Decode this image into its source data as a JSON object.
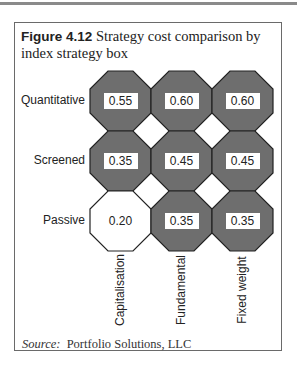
{
  "figure": {
    "number": "Figure 4.12",
    "title": "Strategy cost comparison by index strategy box",
    "source_label": "Source:",
    "source_text": "Portfolio Solutions, LLC"
  },
  "rows": [
    "Quantitative",
    "Screened",
    "Passive"
  ],
  "columns": [
    "Capitalisation",
    "Fundamental",
    "Fixed weight"
  ],
  "cells": [
    [
      "0.55",
      "0.60",
      "0.60"
    ],
    [
      "0.35",
      "0.45",
      "0.45"
    ],
    [
      "0.20",
      "0.35",
      "0.35"
    ]
  ],
  "colors": {
    "shaded_fill": "#6e6e6e",
    "unshaded_fill": "#ffffff",
    "outline": "#222222"
  },
  "chart_data": {
    "type": "table",
    "title": "Strategy cost comparison by index strategy box",
    "row_labels": [
      "Quantitative",
      "Screened",
      "Passive"
    ],
    "column_labels": [
      "Capitalisation",
      "Fundamental",
      "Fixed weight"
    ],
    "values": [
      [
        0.55,
        0.6,
        0.6
      ],
      [
        0.35,
        0.45,
        0.45
      ],
      [
        0.2,
        0.35,
        0.35
      ]
    ],
    "shaded": [
      [
        true,
        true,
        true
      ],
      [
        true,
        true,
        true
      ],
      [
        false,
        true,
        true
      ]
    ]
  }
}
